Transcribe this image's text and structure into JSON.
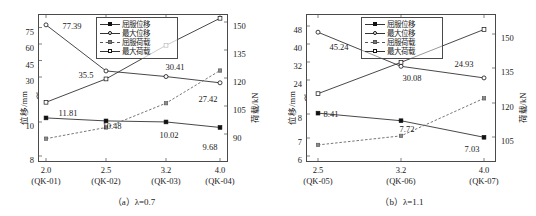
{
  "figure": {
    "panels": [
      {
        "id": "panel-a",
        "caption_prefix": "（a）",
        "caption_symbol": "λ",
        "caption_value": "=0.7",
        "caption_full": "（a）λ=0.7",
        "axes": {
          "y_left_title": "位移/mm",
          "y_right_title": "荷载/kN",
          "y_left_ticks": [
            "8",
            "10",
            "30",
            "45",
            "60",
            "75"
          ],
          "y_right_ticks": [
            "90",
            "105",
            "120",
            "135",
            "150"
          ],
          "x_ticks": [
            {
              "value": "2.0",
              "name": "(QK-01)"
            },
            {
              "value": "2.5",
              "name": "(QK-02)"
            },
            {
              "value": "3.2",
              "name": "(QK-03)"
            },
            {
              "value": "4.0",
              "name": "(QK-04)"
            }
          ],
          "break_marker": "⌇"
        },
        "legend": [
          {
            "label": "屈服位移",
            "marker": "filled-square",
            "line": "solid"
          },
          {
            "label": "最大位移",
            "marker": "open-circle",
            "line": "solid"
          },
          {
            "label": "屈服荷载",
            "marker": "shaded-square",
            "line": "dashed"
          },
          {
            "label": "最大荷载",
            "marker": "open-square",
            "line": "solid"
          }
        ],
        "labels": [
          "77.39",
          "35.5",
          "30.41",
          "27.42",
          "11.81",
          "10.48",
          "10.02",
          "9.68"
        ]
      },
      {
        "id": "panel-b",
        "caption_prefix": "（b）",
        "caption_symbol": "λ",
        "caption_value": "=1.1",
        "caption_full": "（b）λ=1.1",
        "axes": {
          "y_left_title": "位移/mm",
          "y_right_title": "荷载/kN",
          "y_left_ticks": [
            "6",
            "7",
            "8",
            "24",
            "32",
            "40",
            "48"
          ],
          "y_right_ticks": [
            "105",
            "120",
            "135",
            "150"
          ],
          "x_ticks": [
            {
              "value": "2.5",
              "name": "(QK-05)"
            },
            {
              "value": "3.2",
              "name": "(QK-06)"
            },
            {
              "value": "4.0",
              "name": "(QK-07)"
            }
          ],
          "break_marker": "⌇"
        },
        "legend": [
          {
            "label": "屈服位移",
            "marker": "filled-square",
            "line": "solid"
          },
          {
            "label": "最大位移",
            "marker": "open-circle",
            "line": "solid"
          },
          {
            "label": "屈服荷载",
            "marker": "shaded-square",
            "line": "dashed"
          },
          {
            "label": "最大荷载",
            "marker": "open-square",
            "line": "solid"
          }
        ],
        "labels": [
          "45.24",
          "30.08",
          "24.93",
          "8.41",
          "7.72",
          "7.03"
        ]
      }
    ]
  },
  "chart_data": [
    {
      "type": "line",
      "title": "（a）λ=0.7",
      "xlabel": "",
      "ylabel": "位移/mm",
      "y2label": "荷载/kN",
      "categories": [
        "2.0\n(QK-01)",
        "2.5\n(QK-02)",
        "3.2\n(QK-03)",
        "4.0\n(QK-04)"
      ],
      "x_values": [
        "2.0",
        "2.5",
        "3.2",
        "4.0"
      ],
      "specimen_ids": [
        "QK-01",
        "QK-02",
        "QK-03",
        "QK-04"
      ],
      "ylim_left_lower": [
        8,
        10
      ],
      "ylim_left_upper": [
        10,
        78
      ],
      "yticks_left": [
        8,
        10,
        30,
        45,
        60,
        75
      ],
      "ylim_right": [
        84,
        156
      ],
      "yticks_right": [
        90,
        105,
        120,
        135,
        150
      ],
      "axis_break": true,
      "grid": false,
      "legend_position": "top-center",
      "series": [
        {
          "name": "屈服位移",
          "axis": "left",
          "unit": "mm",
          "marker": "filled-square",
          "line": "solid",
          "values": [
            11.81,
            10.48,
            10.02,
            9.68
          ],
          "data_labels": [
            "11.81",
            "10.48",
            "10.02",
            "9.68"
          ]
        },
        {
          "name": "最大位移",
          "axis": "left",
          "unit": "mm",
          "marker": "open-circle",
          "line": "solid",
          "values": [
            77.39,
            35.5,
            30.41,
            27.42
          ],
          "data_labels": [
            "77.39",
            "35.5",
            "30.41",
            "27.42"
          ]
        },
        {
          "name": "屈服荷载",
          "axis": "right",
          "unit": "kN",
          "marker": "shaded-square",
          "line": "dashed",
          "values": [
            87.5,
            93.5,
            106.5,
            124.0
          ],
          "data_labels": []
        },
        {
          "name": "最大荷载",
          "axis": "right",
          "unit": "kN",
          "marker": "open-square",
          "line": "solid",
          "values": [
            107.0,
            119.5,
            137.5,
            152.0
          ],
          "data_labels": []
        }
      ]
    },
    {
      "type": "line",
      "title": "（b）λ=1.1",
      "xlabel": "",
      "ylabel": "位移/mm",
      "y2label": "荷载/kN",
      "categories": [
        "2.5\n(QK-05)",
        "3.2\n(QK-06)",
        "4.0\n(QK-07)"
      ],
      "x_values": [
        "2.5",
        "3.2",
        "4.0"
      ],
      "specimen_ids": [
        "QK-05",
        "QK-06",
        "QK-07"
      ],
      "ylim_left_lower": [
        6,
        8
      ],
      "ylim_left_upper": [
        22,
        50
      ],
      "yticks_left": [
        6,
        7,
        8,
        24,
        32,
        40,
        48
      ],
      "ylim_right": [
        98,
        156
      ],
      "yticks_right": [
        105,
        120,
        135,
        150
      ],
      "axis_break": true,
      "grid": false,
      "legend_position": "top-center",
      "series": [
        {
          "name": "屈服位移",
          "axis": "left",
          "unit": "mm",
          "marker": "filled-square",
          "line": "solid",
          "values": [
            8.41,
            7.72,
            7.03
          ],
          "data_labels": [
            "8.41",
            "7.72",
            "7.03"
          ]
        },
        {
          "name": "最大位移",
          "axis": "left",
          "unit": "mm",
          "marker": "open-circle",
          "line": "solid",
          "values": [
            45.24,
            30.08,
            24.93
          ],
          "data_labels": [
            "45.24",
            "30.08",
            "24.93"
          ]
        },
        {
          "name": "屈服荷载",
          "axis": "right",
          "unit": "kN",
          "marker": "shaded-square",
          "line": "dashed",
          "values": [
            101.5,
            105.5,
            122.0
          ],
          "data_labels": []
        },
        {
          "name": "最大荷载",
          "axis": "right",
          "unit": "kN",
          "marker": "open-square",
          "line": "solid",
          "values": [
            124.0,
            137.5,
            152.0
          ],
          "data_labels": []
        }
      ]
    }
  ],
  "colors": {
    "line": "#333333",
    "dashed_line": "#555555",
    "frame": "#4a4a4a",
    "text": "#1a1a1a",
    "background": "#ffffff"
  }
}
